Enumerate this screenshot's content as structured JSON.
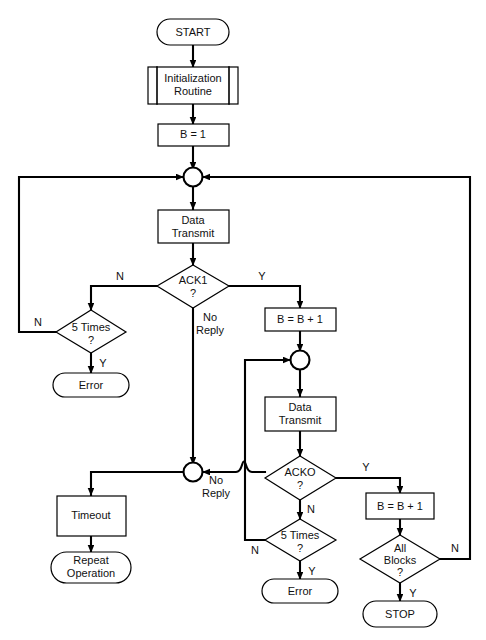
{
  "diagram": {
    "background_color": "#ffffff",
    "line_color": "#000000",
    "text_color": "#111111"
  },
  "nodes": {
    "start": {
      "label": "START",
      "shape": "terminator"
    },
    "init_routine": {
      "label_line1": "Initialization",
      "label_line2": "Routine",
      "shape": "predefined-process"
    },
    "b_equals_1": {
      "label": "B = 1",
      "shape": "process"
    },
    "junction_top": {
      "label": "",
      "shape": "connector"
    },
    "data_transmit_1": {
      "label_line1": "Data",
      "label_line2": "Transmit",
      "shape": "process"
    },
    "ack1_decision": {
      "label_line1": "ACK1",
      "label_line2": "?",
      "shape": "decision"
    },
    "five_times_1": {
      "label_line1": "5 Times",
      "label_line2": "?",
      "shape": "decision"
    },
    "error_1": {
      "label": "Error",
      "shape": "terminator"
    },
    "b_increment_1": {
      "label": "B = B + 1",
      "shape": "process"
    },
    "junction_mid": {
      "label": "",
      "shape": "connector"
    },
    "data_transmit_2": {
      "label_line1": "Data",
      "label_line2": "Transmit",
      "shape": "process"
    },
    "acko_decision": {
      "label_line1": "ACKO",
      "label_line2": "?",
      "shape": "decision"
    },
    "junction_noreply": {
      "label": "",
      "shape": "connector"
    },
    "timeout": {
      "label": "Timeout",
      "shape": "process"
    },
    "repeat_operation": {
      "label_line1": "Repeat",
      "label_line2": "Operation",
      "shape": "terminator"
    },
    "five_times_2": {
      "label_line1": "5 Times",
      "label_line2": "?",
      "shape": "decision"
    },
    "error_2": {
      "label": "Error",
      "shape": "terminator"
    },
    "b_increment_2": {
      "label": "B = B + 1",
      "shape": "process"
    },
    "all_blocks": {
      "label_line1": "All",
      "label_line2": "Blocks",
      "label_line3": "?",
      "shape": "decision"
    },
    "stop": {
      "label": "STOP",
      "shape": "terminator"
    }
  },
  "edge_labels": {
    "ack1_no": "N",
    "ack1_yes": "Y",
    "ack1_noreply_line1": "No",
    "ack1_noreply_line2": "Reply",
    "five_times_1_no": "N",
    "five_times_1_yes": "Y",
    "acko_yes": "Y",
    "acko_no": "N",
    "acko_noreply_line1": "No",
    "acko_noreply_line2": "Reply",
    "five_times_2_no": "N",
    "five_times_2_yes": "Y",
    "all_blocks_no": "N",
    "all_blocks_yes": "Y"
  }
}
